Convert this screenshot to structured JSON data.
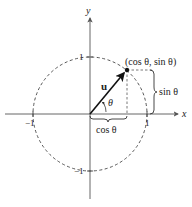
{
  "diagram": {
    "type": "unit-circle",
    "axes": {
      "x_label": "x",
      "y_label": "y"
    },
    "ticks": {
      "x_pos": "1",
      "x_neg": "−1",
      "y_pos": "1",
      "y_neg": "−1"
    },
    "vector_label": "u",
    "angle_label": "θ",
    "point_label": "(cos θ, sin θ)",
    "horizontal_brace_label": "cos θ",
    "vertical_brace_label": "sin θ",
    "colors": {
      "ink": "#222222",
      "axis": "#555555",
      "dashed": "#444444"
    }
  }
}
